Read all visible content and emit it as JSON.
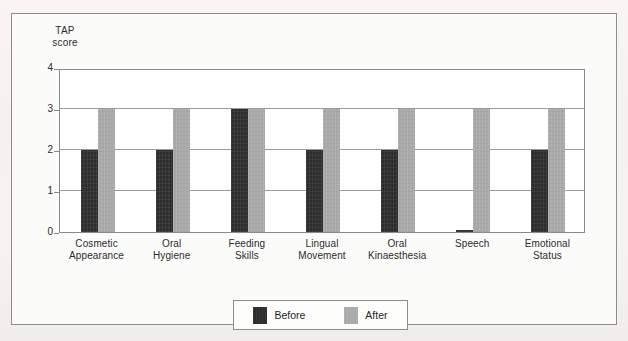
{
  "chart_data": {
    "type": "bar",
    "title": "",
    "xlabel": "",
    "ylabel": "TAP score",
    "ylabel_lines": [
      "TAP",
      "score"
    ],
    "ylim": [
      0,
      4
    ],
    "yticks": [
      0,
      1,
      2,
      3,
      4
    ],
    "ytick_labels": [
      "0",
      "1",
      "2",
      "3",
      "4"
    ],
    "grid": true,
    "legend_position": "bottom-center",
    "categories": [
      "Cosmetic Appearance",
      "Oral Hygiene",
      "Feeding Skills",
      "Lingual Movement",
      "Oral Kinaesthesia",
      "Speech",
      "Emotional Status"
    ],
    "category_lines": [
      [
        "Cosmetic",
        "Appearance"
      ],
      [
        "Oral",
        "Hygiene"
      ],
      [
        "Feeding",
        "Skills"
      ],
      [
        "Lingual",
        "Movement"
      ],
      [
        "Oral",
        "Kinaesthesia"
      ],
      [
        "Speech",
        ""
      ],
      [
        "Emotional",
        "Status"
      ]
    ],
    "series": [
      {
        "name": "Before",
        "color": "#2d2d2d",
        "values": [
          2,
          2,
          3,
          2,
          2,
          0.05,
          2
        ]
      },
      {
        "name": "After",
        "color": "#a9a9a9",
        "values": [
          3,
          3,
          3,
          3,
          3,
          3,
          3
        ]
      }
    ]
  },
  "legend": {
    "entries": [
      {
        "label": "Before"
      },
      {
        "label": "After"
      }
    ]
  },
  "colors": {
    "before": "#2d2d2d",
    "after": "#a9a9a9",
    "axis": "#8a8a8a",
    "frame": "#8d8d8d",
    "paper": "#f6f5f3"
  }
}
